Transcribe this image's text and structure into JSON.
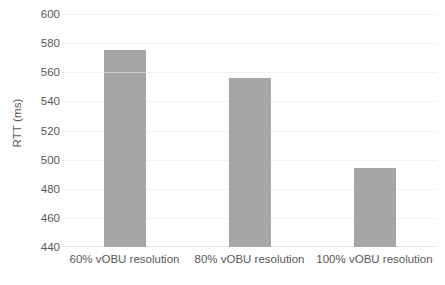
{
  "chart_data": {
    "type": "bar",
    "title": "",
    "xlabel": "",
    "ylabel": "RTT (ms)",
    "categories": [
      "60% vOBU resolution",
      "80% vOBU resolution",
      "100% vOBU resolution"
    ],
    "values": [
      575,
      556,
      494
    ],
    "ylim": [
      440,
      600
    ],
    "yticks": [
      440,
      460,
      480,
      500,
      520,
      540,
      560,
      580,
      600
    ],
    "ytick_labels": [
      "440",
      "460",
      "480",
      "500",
      "520",
      "540",
      "560",
      "580",
      "600"
    ],
    "grid": true,
    "legend": false,
    "legend_position": "none",
    "series": [
      {
        "name": "RTT",
        "color": "#a6a6a6",
        "values": [
          575,
          556,
          494
        ]
      }
    ],
    "bar_color": "#a6a6a6",
    "background_color": "#ffffff",
    "text_color": "#595959",
    "gridline_color": "#f2f2f2"
  }
}
